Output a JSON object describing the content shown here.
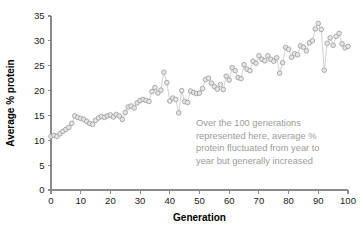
{
  "chart_data": {
    "type": "scatter",
    "title": "",
    "xlabel": "Generation",
    "ylabel": "Average % protein",
    "xlim": [
      0,
      100
    ],
    "ylim": [
      0,
      35
    ],
    "grid": false,
    "legend": false,
    "xticks": [
      "0",
      "10",
      "20",
      "30",
      "40",
      "50",
      "60",
      "70",
      "80",
      "90",
      "100"
    ],
    "xtick_values": [
      0,
      10,
      20,
      30,
      40,
      50,
      60,
      70,
      80,
      90,
      100
    ],
    "yticks": [
      "0",
      "5",
      "10",
      "15",
      "20",
      "25",
      "30",
      "35"
    ],
    "ytick_values": [
      0,
      5,
      10,
      15,
      20,
      25,
      30,
      35
    ],
    "marker_style": "open-circle",
    "marker_fill": "#e6e6e6",
    "marker_stroke": "#9d9d9d",
    "line_color": "#c9c9c9",
    "axis_color": "#8a8a8a",
    "annotation_color": "#9b9b9b",
    "background": "#ffffff",
    "series": [
      {
        "name": "Average % protein",
        "x": [
          0,
          1,
          2,
          3,
          4,
          5,
          6,
          7,
          8,
          9,
          10,
          11,
          12,
          13,
          14,
          15,
          16,
          17,
          18,
          19,
          20,
          21,
          22,
          23,
          24,
          25,
          26,
          27,
          28,
          29,
          30,
          31,
          32,
          33,
          34,
          35,
          36,
          37,
          38,
          39,
          40,
          41,
          42,
          43,
          44,
          45,
          46,
          47,
          48,
          49,
          50,
          51,
          52,
          53,
          54,
          55,
          56,
          57,
          58,
          59,
          60,
          61,
          62,
          63,
          64,
          65,
          66,
          67,
          68,
          69,
          70,
          71,
          72,
          73,
          74,
          75,
          76,
          77,
          78,
          79,
          80,
          81,
          82,
          83,
          84,
          85,
          86,
          87,
          88,
          89,
          90,
          91,
          92,
          93,
          94,
          95,
          96,
          97,
          98,
          99,
          100
        ],
        "values": [
          10.8,
          11.0,
          10.8,
          11.3,
          11.8,
          12.2,
          12.6,
          13.4,
          14.9,
          14.6,
          14.4,
          14.2,
          13.8,
          13.4,
          13.2,
          14.0,
          14.5,
          14.8,
          14.6,
          14.9,
          15.1,
          14.7,
          15.2,
          14.9,
          14.2,
          15.6,
          16.7,
          16.9,
          16.5,
          17.5,
          18.0,
          18.2,
          18.0,
          17.8,
          19.8,
          20.6,
          19.5,
          20.1,
          23.7,
          21.6,
          17.9,
          18.5,
          18.2,
          15.5,
          20.0,
          17.8,
          17.6,
          19.9,
          19.6,
          19.4,
          19.5,
          20.4,
          22.2,
          22.5,
          21.5,
          20.8,
          20.3,
          21.2,
          20.2,
          22.9,
          22.1,
          24.6,
          24.0,
          22.6,
          22.4,
          25.2,
          24.3,
          24.0,
          25.9,
          25.5,
          27.0,
          26.3,
          26.0,
          27.0,
          26.3,
          25.9,
          26.6,
          23.5,
          25.6,
          28.7,
          28.3,
          26.7,
          27.4,
          27.2,
          29.0,
          28.7,
          28.0,
          29.6,
          30.0,
          32.4,
          33.5,
          32.3,
          24.1,
          29.5,
          30.6,
          29.1,
          30.9,
          31.5,
          29.4,
          28.6,
          28.9
        ]
      }
    ],
    "annotation": {
      "lines": [
        "Over the 100 generations",
        "represented here, average %",
        "protein fluctuated from year to",
        "year but generally increased"
      ],
      "full_text": "Over the 100 generations represented here, average % protein fluctuated from year to year but generally increased"
    }
  }
}
